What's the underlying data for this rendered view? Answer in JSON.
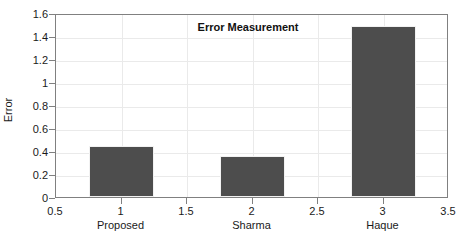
{
  "chart_data": {
    "type": "bar",
    "title": "Error Measurement",
    "xlabel": "",
    "ylabel": "Error",
    "categories": [
      "Proposed",
      "Sharma",
      "Haque"
    ],
    "x": [
      1,
      2,
      3
    ],
    "values": [
      0.44,
      0.36,
      1.49
    ],
    "bar_width": 0.5,
    "bar_color": "#4d4d4d",
    "bar_edge_color": "#f2f2f2",
    "xlim": [
      0.5,
      3.5
    ],
    "ylim": [
      0,
      1.6
    ],
    "xticks": [
      0.5,
      1,
      1.5,
      2,
      2.5,
      3,
      3.5
    ],
    "xtick_labels": [
      "0.5",
      "1",
      "1.5",
      "2",
      "2.5",
      "3",
      "3.5"
    ],
    "yticks": [
      0,
      0.2,
      0.4,
      0.6,
      0.8,
      1,
      1.2,
      1.4,
      1.6
    ],
    "ytick_labels": [
      "0",
      "0.2",
      "0.4",
      "0.6",
      "0.8",
      "1",
      "1.2",
      "1.4",
      "1.6"
    ],
    "grid": true,
    "grid_color": "#eaeaea",
    "axis_color": "#808080",
    "legend": null,
    "background": "#ffffff"
  },
  "figure": {
    "title": "Error Measurement",
    "ylabel": "Error"
  }
}
